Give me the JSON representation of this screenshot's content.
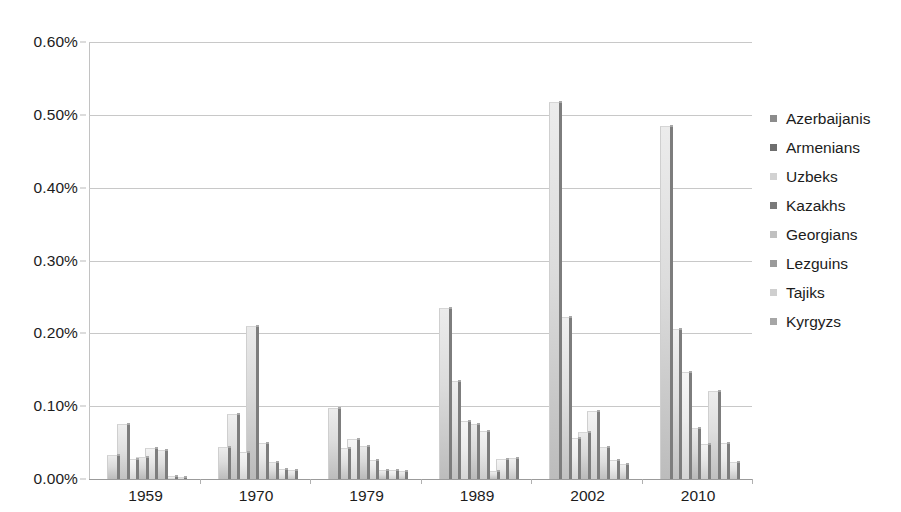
{
  "chart_data": {
    "type": "bar",
    "title": "",
    "subtitle": "",
    "xlabel": "",
    "ylabel": "",
    "categories": [
      "1959",
      "1970",
      "1979",
      "1989",
      "2002",
      "2010"
    ],
    "ylim": [
      0,
      0.6
    ],
    "y_ticks": [
      0.0,
      0.1,
      0.2,
      0.3,
      0.4,
      0.5,
      0.6
    ],
    "y_tick_labels": [
      "0.00%",
      "0.10%",
      "0.20%",
      "0.30%",
      "0.40%",
      "0.50%",
      "0.60%"
    ],
    "value_unit": "%",
    "grid": true,
    "legend_position": "right",
    "series": [
      {
        "name": "Azerbaijanis",
        "color": "#8c8c8c",
        "values": [
          0.033,
          0.044,
          0.098,
          0.235,
          0.518,
          0.485
        ]
      },
      {
        "name": "Armenians",
        "color": "#6e6e6e",
        "values": [
          0.075,
          0.089,
          0.043,
          0.135,
          0.222,
          0.206
        ]
      },
      {
        "name": "Uzbeks",
        "color": "#d2d2d2",
        "values": [
          0.028,
          0.037,
          0.055,
          0.079,
          0.057,
          0.147
        ]
      },
      {
        "name": "Kazakhs",
        "color": "#7a7a7a",
        "values": [
          0.03,
          0.21,
          0.045,
          0.075,
          0.064,
          0.07
        ]
      },
      {
        "name": "Georgians",
        "color": "#c0c0c0",
        "values": [
          0.042,
          0.05,
          0.026,
          0.066,
          0.094,
          0.048
        ]
      },
      {
        "name": "Lezguins",
        "color": "#9a9a9a",
        "values": [
          0.04,
          0.024,
          0.013,
          0.011,
          0.044,
          0.121
        ]
      },
      {
        "name": "Tajiks",
        "color": "#cfcfcf",
        "values": [
          0.004,
          0.014,
          0.012,
          0.027,
          0.026,
          0.05
        ]
      },
      {
        "name": "Kyrgyzs",
        "color": "#a6a6a6",
        "values": [
          0.003,
          0.012,
          0.011,
          0.029,
          0.02,
          0.024
        ]
      }
    ]
  },
  "legend": {
    "items": [
      {
        "label": "Azerbaijanis"
      },
      {
        "label": "Armenians"
      },
      {
        "label": "Uzbeks"
      },
      {
        "label": "Kazakhs"
      },
      {
        "label": "Georgians"
      },
      {
        "label": "Lezguins"
      },
      {
        "label": "Tajiks"
      },
      {
        "label": "Kyrgyzs"
      }
    ]
  }
}
